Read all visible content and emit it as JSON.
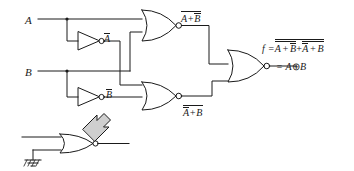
{
  "diagram": {
    "type": "logic-circuit-schematic",
    "stroke_color": "#1a1a1a",
    "background_color": "#ffffff",
    "inputs": [
      {
        "id": "A",
        "label": "A",
        "x": 25,
        "y": 15
      },
      {
        "id": "B",
        "label": "B",
        "x": 25,
        "y": 67
      }
    ],
    "labels": {
      "input_a": "A",
      "input_b": "B",
      "inv_a_out": "A",
      "inv_b_out": "B",
      "nor_top_out": "A+B",
      "nor_bottom_out_inner": "A+B",
      "f_prefix": "f =",
      "f_term1": "A + B",
      "f_plus": "+",
      "f_term2": "A + B",
      "equals_xor": "= A",
      "xor_symbol": "⊕",
      "xor_operand": "B"
    },
    "gates": [
      {
        "id": "inv-a",
        "type": "inverter",
        "name": "inverter-a",
        "output_label": "A-bar"
      },
      {
        "id": "inv-b",
        "type": "inverter",
        "name": "inverter-b",
        "output_label": "B-bar"
      },
      {
        "id": "nor-top",
        "type": "nor",
        "name": "nor-gate-top",
        "inputs": [
          "A",
          "B-bar"
        ],
        "output_label": "not(A + B-bar)"
      },
      {
        "id": "nor-bottom",
        "type": "nor",
        "name": "nor-gate-bottom",
        "inputs": [
          "A-bar",
          "B"
        ],
        "output_label": "not(A-bar + B)"
      },
      {
        "id": "nor-out",
        "type": "nor",
        "name": "nor-gate-output",
        "inputs": [
          "nor-top",
          "nor-bottom"
        ],
        "output_label": "f"
      },
      {
        "id": "nor-equiv",
        "type": "nor",
        "name": "nor-gate-as-inverter",
        "inputs": [
          "signal",
          "ground"
        ],
        "note": "NOR with grounded input equals inverter"
      }
    ],
    "annotations": [
      {
        "id": "equiv-arrow",
        "name": "equivalence-arrow",
        "shape": "hollow-block-arrow",
        "direction": "up-right",
        "meaning": "NOR gate with grounded input is equivalent to the inverter above"
      },
      {
        "id": "ground",
        "name": "ground-symbol",
        "shape": "earth-ground"
      }
    ],
    "junctions": [
      {
        "id": "j-a",
        "name": "junction-a",
        "x": 67,
        "y": 19
      },
      {
        "id": "j-b",
        "name": "junction-b",
        "x": 67,
        "y": 71
      }
    ]
  }
}
